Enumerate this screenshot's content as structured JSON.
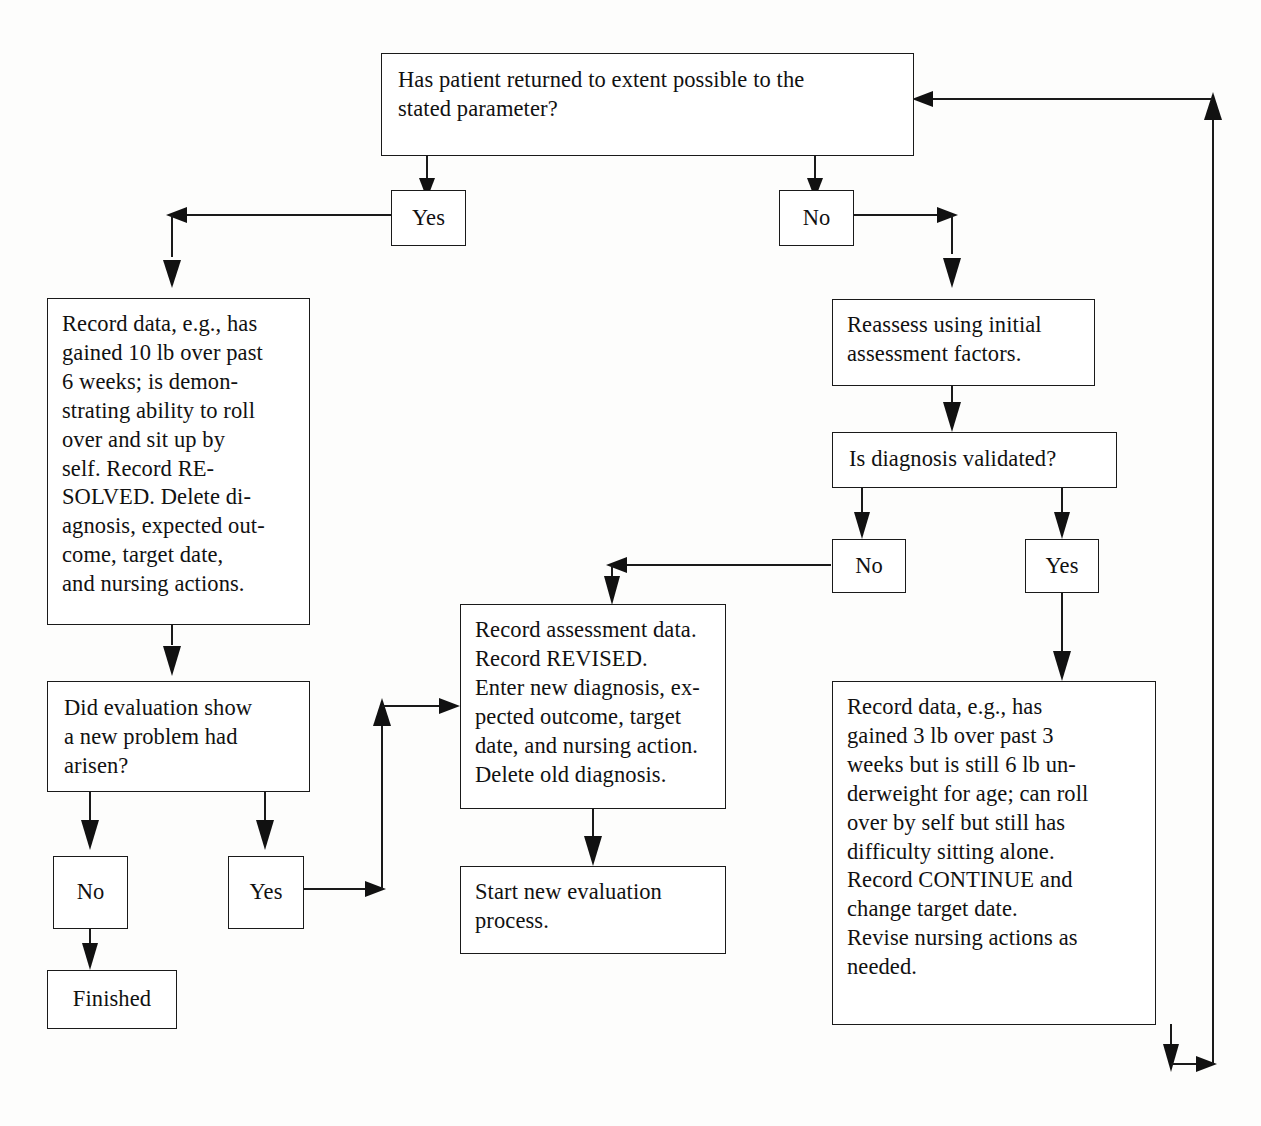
{
  "diagram": {
    "line_color": "#1a1a1a",
    "box_fill": "#ffffff",
    "text_color": "#111111"
  },
  "nodes": {
    "q_returned": "Has patient returned to extent possible to the stated parameter?",
    "yes_top": "Yes",
    "no_top": "No",
    "record_resolved": "Record data, e.g., has gained 10 lb over past 6 weeks; is demonstrating ability to roll over and sit up by self. Record RESOLVED. Delete diagnosis, expected outcome, target date, and nursing actions.",
    "q_new_problem": "Did evaluation show a new problem had arisen?",
    "no_new_problem": "No",
    "yes_new_problem": "Yes",
    "finished": "Finished",
    "record_revised": "Record assessment data. Record REVISED. Enter new diagnosis, expected outcome, target date, and nursing action. Delete old diagnosis.",
    "start_new": "Start new evaluation process.",
    "reassess": "Reassess using initial assessment factors.",
    "q_validated": "Is diagnosis validated?",
    "no_validated": "No",
    "yes_validated": "Yes",
    "record_continue": "Record data, e.g., has gained 3 lb over past 3 weeks but is still 6 lb underweight for age; can roll over by self but still has difficulty sitting alone. Record CONTINUE and change target date. Revise nursing actions as needed."
  },
  "node_text_lines": {
    "q_returned": "Has patient returned to extent possible to the\nstated parameter?",
    "record_resolved": "Record data, e.g., has\ngained 10 lb over past\n6 weeks; is demon-\nstrating ability to roll\nover and sit up by\nself. Record RE-\nSOLVED. Delete di-\nagnosis, expected out-\ncome, target date,\nand nursing actions.",
    "q_new_problem": "Did evaluation show\na new problem had\narisen?",
    "record_revised": "Record assessment data.\nRecord REVISED.\nEnter new diagnosis, ex-\npected outcome, target\ndate, and nursing action.\nDelete old diagnosis.",
    "start_new": "Start new evaluation\nprocess.",
    "reassess": "Reassess using initial\nassessment factors.",
    "q_validated": "Is diagnosis validated?",
    "record_continue": "Record data, e.g., has\ngained 3 lb over past 3\nweeks but is still 6 lb un-\nderweight for age; can roll\nover by self but still has\ndifficulty sitting alone.\nRecord CONTINUE and\nchange target date.\nRevise nursing actions as\nneeded."
  },
  "flow_edges": [
    {
      "from": "q_returned",
      "to": "yes_top",
      "label": ""
    },
    {
      "from": "q_returned",
      "to": "no_top",
      "label": ""
    },
    {
      "from": "yes_top",
      "to": "record_resolved",
      "label": ""
    },
    {
      "from": "record_resolved",
      "to": "q_new_problem",
      "label": ""
    },
    {
      "from": "q_new_problem",
      "to": "no_new_problem",
      "label": ""
    },
    {
      "from": "q_new_problem",
      "to": "yes_new_problem",
      "label": ""
    },
    {
      "from": "no_new_problem",
      "to": "finished",
      "label": ""
    },
    {
      "from": "yes_new_problem",
      "to": "record_revised",
      "label": ""
    },
    {
      "from": "record_revised",
      "to": "start_new",
      "label": ""
    },
    {
      "from": "no_top",
      "to": "reassess",
      "label": ""
    },
    {
      "from": "reassess",
      "to": "q_validated",
      "label": ""
    },
    {
      "from": "q_validated",
      "to": "no_validated",
      "label": ""
    },
    {
      "from": "q_validated",
      "to": "yes_validated",
      "label": ""
    },
    {
      "from": "no_validated",
      "to": "record_revised",
      "label": ""
    },
    {
      "from": "yes_validated",
      "to": "record_continue",
      "label": ""
    },
    {
      "from": "record_continue",
      "to": "q_returned",
      "label": "loop back"
    }
  ]
}
